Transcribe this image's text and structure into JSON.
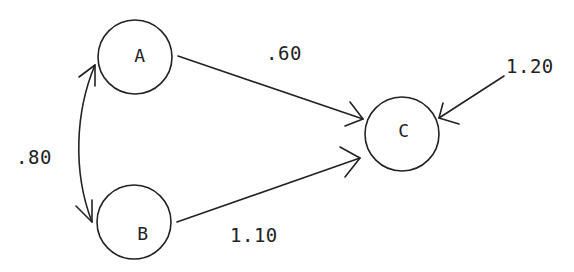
{
  "diagram": {
    "type": "path-diagram",
    "nodes": [
      {
        "id": "A",
        "label": "A"
      },
      {
        "id": "B",
        "label": "B"
      },
      {
        "id": "C",
        "label": "C"
      }
    ],
    "edges": [
      {
        "from": "A",
        "to": "C",
        "label": ".60",
        "kind": "directed"
      },
      {
        "from": "B",
        "to": "C",
        "label": "1.10",
        "kind": "directed"
      },
      {
        "from": "A",
        "to": "B",
        "label": ".80",
        "kind": "bidirectional-curved"
      },
      {
        "from": "external",
        "to": "C",
        "label": "1.20",
        "kind": "directed"
      }
    ]
  },
  "labels": {
    "node_a": "A",
    "node_b": "B",
    "node_c": "C",
    "edge_ac": ".60",
    "edge_bc": "1.10",
    "edge_ab": ".80",
    "edge_ext_c": "1.20"
  },
  "colors": {
    "stroke": "#222222",
    "background": "#ffffff"
  }
}
